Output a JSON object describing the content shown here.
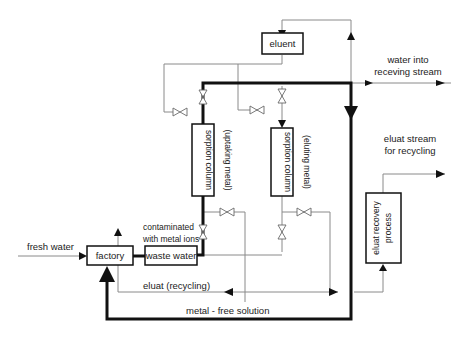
{
  "diagram": {
    "title": "",
    "nodes": {
      "eluent": {
        "label": "eluent"
      },
      "factory": {
        "label": "factory"
      },
      "waste_water": {
        "label": "waste water"
      },
      "column_uptake": {
        "label": "sorption column",
        "sublabel": "(uptaking metal)"
      },
      "column_elute": {
        "label": "sorption column",
        "sublabel": "(eluting metal)"
      },
      "eluat_recovery": {
        "label_line1": "eluat recovery",
        "label_line2": "process"
      }
    },
    "labels": {
      "fresh_water": "fresh water",
      "contaminated_line1": "contaminated",
      "contaminated_line2": "with metal ions",
      "water_into_line1": "water into",
      "water_into_line2": "receving stream",
      "eluat_stream_line1": "eluat stream",
      "eluat_stream_line2": "for recycling",
      "eluat_recycling": "eluat (recycling)",
      "metal_free_solution": "metal - free solution"
    },
    "colors": {
      "main_flow": "#111111",
      "secondary_flow": "#8a8a8a",
      "background": "#ffffff"
    }
  }
}
